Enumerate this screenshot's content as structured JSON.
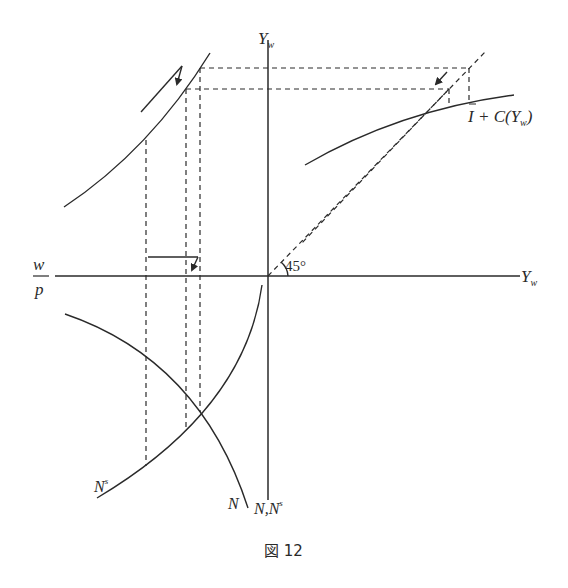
{
  "diagram": {
    "caption": "図 12",
    "axes": {
      "vertical_top_label": "Y",
      "vertical_top_sub": "w",
      "horizontal_right_label": "Y",
      "horizontal_right_sub": "w",
      "horizontal_left_num": "w",
      "horizontal_left_den": "p",
      "vertical_bottom_label": "N,N",
      "vertical_bottom_sup": "s"
    },
    "angle_label": "45°",
    "curves": {
      "demand_label_bar": "I",
      "demand_label_rest": " + C(Y",
      "demand_label_sub": "w",
      "demand_label_close": ")",
      "labor_demand_label": "N",
      "labor_supply_label": "N",
      "labor_supply_sup": "s"
    },
    "colors": {
      "ink": "#2a2a2a",
      "background": "#ffffff"
    }
  }
}
